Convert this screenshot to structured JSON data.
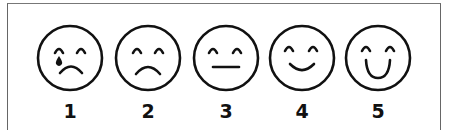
{
  "scale": {
    "type": "face-rating-scale",
    "faces": [
      {
        "value": "1",
        "expression": "crying",
        "cx": 70,
        "mouth": "frown",
        "tear": true
      },
      {
        "value": "2",
        "expression": "sad",
        "cx": 148,
        "mouth": "frown",
        "tear": false
      },
      {
        "value": "3",
        "expression": "neutral",
        "cx": 226,
        "mouth": "flat",
        "tear": false
      },
      {
        "value": "4",
        "expression": "happy",
        "cx": 302,
        "mouth": "smile",
        "tear": false
      },
      {
        "value": "5",
        "expression": "very-happy",
        "cx": 378,
        "mouth": "big-smile",
        "tear": false
      }
    ]
  },
  "colors": {
    "ink": "#111111",
    "frame": "#666666",
    "background": "#ffffff"
  }
}
